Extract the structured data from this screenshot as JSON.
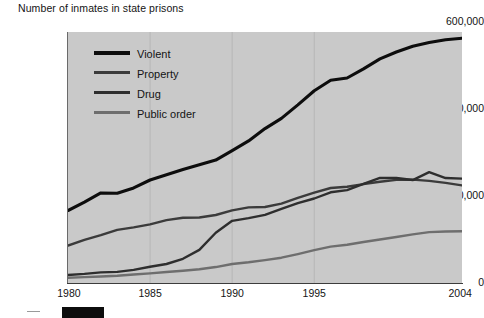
{
  "chart_data": {
    "type": "line",
    "title": "Number of inmates in state prisons",
    "xlabel": "",
    "ylabel": "",
    "xlim": [
      1980,
      2004
    ],
    "ylim": [
      0,
      600000
    ],
    "grid": true,
    "legend_position": "upper-left-inside",
    "y_ticks": [
      "0",
      "200,000",
      "400,000",
      "600,000"
    ],
    "y_tick_values": [
      0,
      200000,
      400000,
      600000
    ],
    "x_ticks": [
      "1980",
      "1985",
      "1990",
      "1995",
      "2004"
    ],
    "x_tick_values": [
      1980,
      1985,
      1990,
      1995,
      2004
    ],
    "x": [
      1980,
      1981,
      1982,
      1983,
      1984,
      1985,
      1986,
      1987,
      1988,
      1989,
      1990,
      1991,
      1992,
      1993,
      1994,
      1995,
      1996,
      1997,
      1998,
      1999,
      2000,
      2001,
      2002,
      2003,
      2004
    ],
    "series": [
      {
        "name": "Violent",
        "color": "#0d0d0d",
        "values": [
          173300,
          193300,
          215300,
          214400,
          227300,
          246200,
          258600,
          271300,
          282900,
          293900,
          316600,
          339700,
          369100,
          393500,
          425700,
          459600,
          484800,
          490000,
          511900,
          535600,
          552100,
          565800,
          574800,
          581600,
          585200
        ]
      },
      {
        "name": "Property",
        "color": "#3b3b3b",
        "values": [
          89300,
          103000,
          114400,
          127100,
          133100,
          140100,
          150200,
          155900,
          156500,
          162600,
          173700,
          180700,
          181600,
          189600,
          203500,
          216000,
          227100,
          230000,
          236500,
          242000,
          246600,
          247100,
          244100,
          239400,
          233400
        ]
      },
      {
        "name": "Drug",
        "color": "#2e2e2e",
        "values": [
          19000,
          21700,
          25300,
          26600,
          31300,
          38900,
          45400,
          57900,
          79100,
          120100,
          148600,
          155200,
          162900,
          177000,
          190700,
          202000,
          216900,
          222100,
          236800,
          251200,
          251100,
          246100,
          265100,
          250900,
          249400
        ]
      },
      {
        "name": "Public order",
        "color": "#6e6e6e",
        "values": [
          12400,
          14100,
          15500,
          17300,
          20300,
          23000,
          26300,
          29300,
          32900,
          38100,
          45500,
          49500,
          54600,
          60500,
          69200,
          78400,
          87000,
          91500,
          97900,
          104100,
          110100,
          116200,
          121600,
          123000,
          123600
        ]
      }
    ]
  },
  "legend": {
    "items": [
      {
        "label": "Violent",
        "color": "#0d0d0d"
      },
      {
        "label": "Property",
        "color": "#3b3b3b"
      },
      {
        "label": "Drug",
        "color": "#2e2e2e"
      },
      {
        "label": "Public order",
        "color": "#6e6e6e"
      }
    ]
  },
  "colors": {
    "plot_background": "#c9c9c9",
    "page_background": "#ffffff",
    "axis": "#3c3c3c",
    "gridline": "#b7b7b7",
    "text": "#141414",
    "marker_bar": "#0d0d0d"
  },
  "footer": {
    "marker_bar_visible": true
  }
}
